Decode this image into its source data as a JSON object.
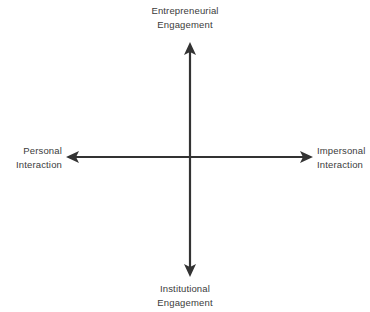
{
  "diagram": {
    "type": "two-axis-quadrant-framework",
    "background_color": "#ffffff",
    "axis_color": "#333333",
    "label_color": "#3b3b3b",
    "axes": {
      "vertical": {
        "top_pole": {
          "line_1": "Entrepreneurial",
          "line_2": "Engagement"
        },
        "bottom_pole": {
          "line_1": "Institutional",
          "line_2": "Engagement"
        }
      },
      "horizontal": {
        "left_pole": {
          "line_1": "Personal",
          "line_2": "Interaction"
        },
        "right_pole": {
          "line_1": "Impersonal",
          "line_2": "Interaction"
        }
      }
    },
    "geometry": {
      "origin_x": 190,
      "origin_y": 157,
      "vertical_top_y": 42,
      "vertical_bottom_y": 277,
      "horizontal_left_x": 66,
      "horizontal_right_x": 313,
      "stroke_width": 2.2,
      "arrowhead_length": 13,
      "arrowhead_half_width": 6
    }
  }
}
